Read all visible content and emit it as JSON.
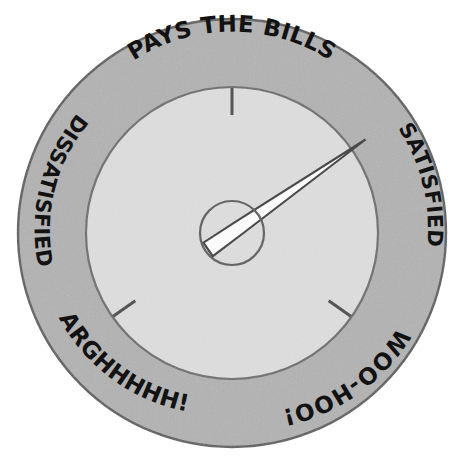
{
  "figure": {
    "kind": "gauge-dial-illustration",
    "width": 464,
    "height": 474
  },
  "colors": {
    "page_background": "#ffffff",
    "outer_ring_fill": "#b2b2b2",
    "outer_ring_stroke": "#5a5a5a",
    "dial_face_fill": "#dedede",
    "dial_face_stroke": "#6e6e6e",
    "needle_fill": "#fbfbfb",
    "needle_stroke": "#4a4a4a",
    "hub_stroke": "#666666",
    "tick_color": "#555555",
    "label_text": "#121212"
  },
  "gauge": {
    "center_x": 232,
    "center_y": 233,
    "outer_radius": 215,
    "ring_inner_radius": 148,
    "dial_face_radius": 145,
    "hub_radius": 32,
    "needle_angle_deg": 55,
    "needle_length": 168,
    "needle_tail_length": 45,
    "needle_label": "gauge-needle",
    "reading": "SATISFIED"
  },
  "labels": [
    {
      "id": "pays-the-bills",
      "text": "PAYS THE BILLS",
      "position": "top",
      "center_angle_deg": 0,
      "direction": "clockwise",
      "size": "major"
    },
    {
      "id": "dissatisfied",
      "text": "DISSATISFIED",
      "position": "upper-left",
      "center_angle_deg": -52,
      "direction": "counter-clockwise",
      "size": "mid"
    },
    {
      "id": "satisfied",
      "text": "SATISFIED",
      "position": "upper-right",
      "center_angle_deg": 56,
      "direction": "clockwise",
      "size": "mid"
    },
    {
      "id": "arghhhhh",
      "text": "ARGHHHHH!",
      "position": "lower-left",
      "center_angle_deg": -124,
      "direction": "counter-clockwise",
      "size": "major"
    },
    {
      "id": "woo-hoo",
      "text": "WOO-HOO!",
      "position": "lower-right",
      "center_angle_deg": 124,
      "direction": "clockwise",
      "size": "major"
    }
  ],
  "ticks": [
    {
      "id": "tick-top",
      "angle_deg": 0,
      "label": "top-tick"
    },
    {
      "id": "tick-lower-left",
      "angle_deg": -125,
      "label": "lower-left-tick"
    },
    {
      "id": "tick-lower-right",
      "angle_deg": 125,
      "label": "lower-right-tick"
    }
  ]
}
